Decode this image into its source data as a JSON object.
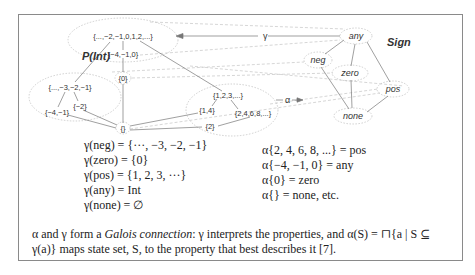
{
  "figure": {
    "left_label": "P(Int)",
    "right_label": "Sign",
    "gamma_arrow_label": "γ",
    "alpha_arrow_label": "α",
    "powerset_nodes": [
      {
        "id": "all",
        "text": "{...,−2,−1,0,1,2,...}"
      },
      {
        "id": "m410",
        "text": "{−4,−1,0}"
      },
      {
        "id": "zero",
        "text": "{0}"
      },
      {
        "id": "negs",
        "text": "{...,−3,−2,−1}"
      },
      {
        "id": "m2",
        "text": "{−2}"
      },
      {
        "id": "m41",
        "text": "{−4,−1}"
      },
      {
        "id": "empty",
        "text": "{}"
      },
      {
        "id": "pos",
        "text": "{1,2,3,...}"
      },
      {
        "id": "p14",
        "text": "{1,4}"
      },
      {
        "id": "evens",
        "text": "{2,4,6,8,...}"
      },
      {
        "id": "p2",
        "text": "{2}"
      }
    ],
    "sign_nodes": [
      {
        "id": "any",
        "text": "any"
      },
      {
        "id": "neg",
        "text": "neg"
      },
      {
        "id": "zero",
        "text": "zero"
      },
      {
        "id": "pos",
        "text": "pos"
      },
      {
        "id": "none",
        "text": "none"
      }
    ]
  },
  "gamma_equations": [
    "γ(neg) = {···, −3, −2, −1}",
    "γ(zero) = {0}",
    "γ(pos) = {1, 2, 3, ···}",
    "γ(any) = Int",
    "γ(none) = ∅"
  ],
  "alpha_equations": [
    "α{2, 4, 6, 8, ...} = pos",
    "α{−4, −1, 0} = any",
    "α{0} = zero",
    "α{} = none,  etc."
  ],
  "caption": {
    "part1": "α and γ form a ",
    "italic": "Galois connection",
    "part2": ": γ interprets the properties, and α(S) = ⊓{a | S ⊆ γ(a)} maps state set, S, to the property that best describes it [7]."
  }
}
